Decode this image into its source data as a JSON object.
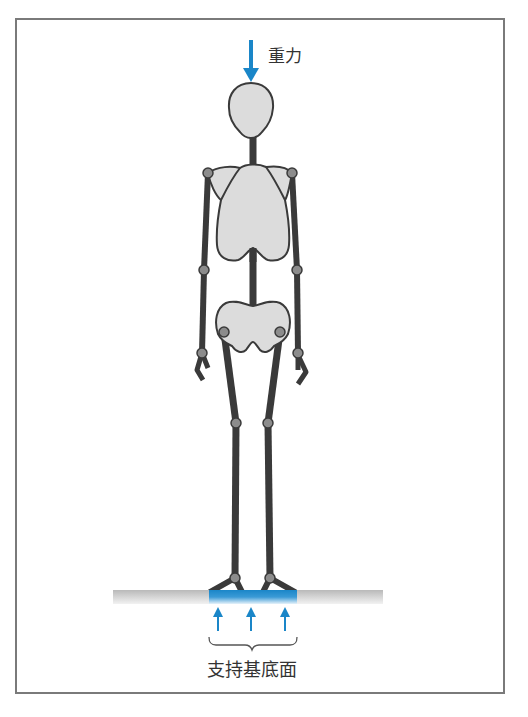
{
  "diagram": {
    "gravity_label": "重力",
    "base_of_support_label": "支持基底面",
    "colors": {
      "arrow_blue": "#1a86c8",
      "bone": "#3a3a3a",
      "joint": "#8c8c8c",
      "body_fill": "#dcdcdc",
      "ground": "#c8c8c8",
      "frame": "#7a7a7a",
      "text": "#333333"
    },
    "figure": {
      "parts": [
        "head",
        "spine",
        "ribcage",
        "pelvis",
        "left-arm",
        "right-arm",
        "left-leg",
        "right-leg",
        "left-foot",
        "right-foot"
      ],
      "joints": [
        "left-shoulder",
        "right-shoulder",
        "left-elbow",
        "right-elbow",
        "left-wrist",
        "right-wrist",
        "left-hip",
        "right-hip",
        "left-knee",
        "right-knee",
        "left-ankle",
        "right-ankle"
      ]
    },
    "support_arrows_count": 3
  }
}
